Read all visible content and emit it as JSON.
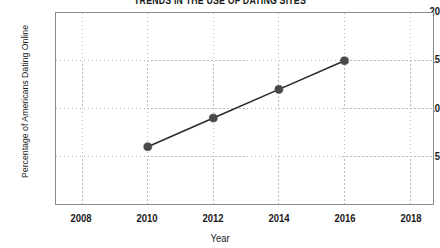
{
  "chart_data": {
    "type": "line",
    "title": "TRENDS IN THE USE OF DATING SITES",
    "xlabel": "Year",
    "ylabel": "Percentage of Americans Dating Online",
    "x": [
      2010,
      2012,
      2014,
      2016
    ],
    "values": [
      6,
      9,
      12,
      15
    ],
    "series": [
      {
        "name": "Percentage of Americans Dating Online",
        "values": [
          6,
          9,
          12,
          15
        ]
      }
    ],
    "points": [
      {
        "x": 2010,
        "y": 6
      },
      {
        "x": 2012,
        "y": 9
      },
      {
        "x": 2014,
        "y": 12
      },
      {
        "x": 2016,
        "y": 15
      }
    ],
    "xlim": [
      2007.2,
      2018.7
    ],
    "ylim": [
      0,
      20
    ],
    "xticks": [
      2008,
      2010,
      2012,
      2014,
      2016,
      2018
    ],
    "xtick_labels": [
      "2008",
      "2010",
      "2012",
      "2014",
      "2016",
      "2018"
    ],
    "yticks": [
      5,
      10,
      15,
      20
    ],
    "ytick_labels": [
      "5",
      "10",
      "15",
      "20"
    ],
    "grid": true,
    "grid_style": "dotted",
    "legend": false,
    "legend_position": "none",
    "colors": {
      "line": "#2b2b2b",
      "marker": "#4a4a4a",
      "grid": "#b9b9b9",
      "frame": "#8c8c8c",
      "text": "#1a1a1a",
      "background": "#ffffff"
    }
  }
}
